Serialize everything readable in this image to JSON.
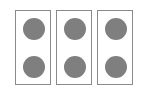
{
  "diagram": {
    "colors": {
      "background": "#ffffff",
      "panel_border": "#8a8a8a",
      "dot_fill": "#7f7f7f"
    },
    "panels": [
      {
        "label": "panel-1",
        "dot_count": 2
      },
      {
        "label": "panel-2",
        "dot_count": 2
      },
      {
        "label": "panel-3",
        "dot_count": 2
      }
    ],
    "total_dots": 6
  }
}
